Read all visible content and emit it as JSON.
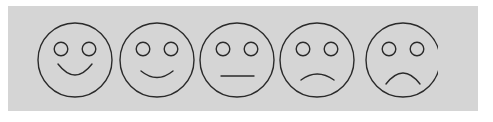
{
  "widget": {
    "name": "smiley-face-rating-scale",
    "description": "Five-point emoticon rating scale from happy to sad",
    "canvas_width": 493,
    "canvas_height": 122,
    "background_color": "#ffffff",
    "panel_color": "#d5d5d5",
    "stroke_color": "#2a2a2a",
    "stroke_width": 1.4
  },
  "panel": {
    "x": 8,
    "y": 6,
    "width": 470,
    "height": 105
  },
  "faces": [
    {
      "index": 1,
      "name": "very-happy-face",
      "expression": "very happy",
      "mouth_type": "deep-smile",
      "rating": 5,
      "cell_x": 26,
      "center_x": 41,
      "center_y": 54,
      "radius": 37,
      "eye_offset_x": 14,
      "eye_offset_y": 11,
      "eye_radius": 6.8,
      "mouth_path": "M 24 58 Q 41 80 58 58",
      "mouth_width": 34
    },
    {
      "index": 2,
      "name": "happy-face",
      "expression": "happy",
      "mouth_type": "shallow-smile",
      "rating": 4,
      "cell_x": 108,
      "center_x": 41,
      "center_y": 54,
      "radius": 37,
      "eye_offset_x": 14,
      "eye_offset_y": 11,
      "eye_radius": 6.8,
      "mouth_path": "M 25 65 Q 41 78 57 65",
      "mouth_width": 32
    },
    {
      "index": 3,
      "name": "neutral-face",
      "expression": "neutral",
      "mouth_type": "straight-line",
      "rating": 3,
      "cell_x": 188,
      "center_x": 41,
      "center_y": 54,
      "radius": 37,
      "eye_offset_x": 14,
      "eye_offset_y": 11,
      "eye_radius": 6.8,
      "mouth_path": "M 25 70 L 58 70",
      "mouth_width": 33
    },
    {
      "index": 4,
      "name": "sad-face",
      "expression": "sad",
      "mouth_type": "shallow-frown",
      "rating": 2,
      "cell_x": 268,
      "center_x": 41,
      "center_y": 54,
      "radius": 37,
      "eye_offset_x": 14,
      "eye_offset_y": 11,
      "eye_radius": 6.8,
      "mouth_path": "M 25 74 Q 41 62 58 74",
      "mouth_width": 33
    },
    {
      "index": 5,
      "name": "very-sad-face",
      "expression": "very sad",
      "mouth_type": "deep-frown",
      "rating": 1,
      "cell_x": 348,
      "center_x": 47,
      "center_y": 54,
      "radius": 37,
      "eye_offset_x": 14,
      "eye_offset_y": 11,
      "eye_radius": 6.8,
      "mouth_path": "M 30 78 Q 47 56 64 78",
      "mouth_width": 34
    }
  ]
}
